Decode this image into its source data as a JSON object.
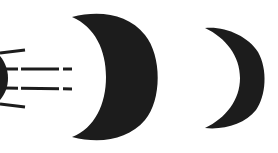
{
  "diagram": {
    "type": "symbol",
    "colors": {
      "ink": "#1c1c1c",
      "background": "#ffffff"
    },
    "elements": [
      {
        "id": "partial-disc",
        "shape": "partial-dark-disc-edge",
        "position": "left edge"
      },
      {
        "id": "motion-lines",
        "shape": "lines",
        "count": 4,
        "styles": [
          "solid",
          "dashed",
          "dashed",
          "solid"
        ]
      },
      {
        "id": "large-crescent",
        "shape": "crescent",
        "size": "large"
      },
      {
        "id": "small-crescent",
        "shape": "crescent",
        "size": "small"
      }
    ]
  }
}
